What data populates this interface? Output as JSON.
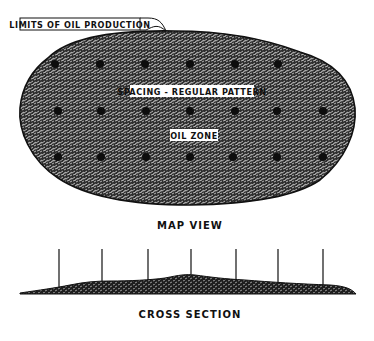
{
  "diagram": {
    "map_view": {
      "caption": "MAP VIEW",
      "callout_label": "LIMITS OF OIL PRODUCTION",
      "pattern_label": "SPACING - REGULAR PATTERN",
      "zone_label": "OIL ZONE",
      "colors": {
        "fill": "#3a3a3a",
        "outline": "#111111",
        "wells": "#0d0d0d"
      },
      "wells": {
        "row1": [
          55,
          100,
          145,
          190,
          235,
          278
        ],
        "row2": [
          58,
          101,
          146,
          190,
          235,
          277,
          323
        ],
        "row3": [
          58,
          101,
          146,
          190,
          233,
          277,
          323
        ],
        "row_y": [
          64,
          111,
          157
        ]
      }
    },
    "cross_section": {
      "caption": "CROSS SECTION",
      "well_count": 7,
      "well_x": [
        59,
        102,
        148,
        191,
        236,
        278,
        323
      ]
    }
  }
}
